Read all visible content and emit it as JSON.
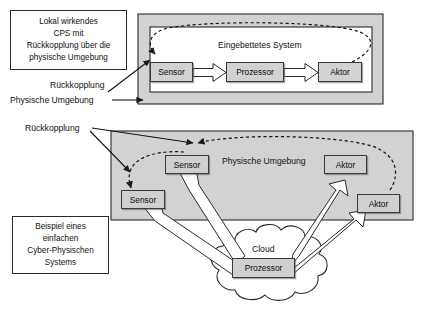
{
  "figure": {
    "colors": {
      "environment_fill": "#d2d2d2",
      "node_fill": "#d2d2d2",
      "stroke": "#2a2a2a",
      "background": "#ffffff"
    }
  },
  "top_panel": {
    "callout": {
      "lines": [
        "Lokal wirkendes",
        "CPS mit",
        "Rückkopplung über die",
        "physische Umgebung"
      ]
    },
    "annotations": [
      {
        "label": "Rückkopplung"
      },
      {
        "label": "Physische Umgebung"
      }
    ],
    "embedded_system_label": "Eingebettetes System",
    "nodes": [
      {
        "label": "Sensor"
      },
      {
        "label": "Prozessor"
      },
      {
        "label": "Aktor"
      }
    ]
  },
  "bottom_panel": {
    "callout": {
      "lines": [
        "Beispiel eines",
        "einfachen",
        "Cyber-Physischen",
        "Systems"
      ]
    },
    "annotations": [
      {
        "label": "Rückkopplung"
      }
    ],
    "environment_label": "Physische Umgebung",
    "cloud_label": "Cloud",
    "nodes": [
      {
        "label": "Sensor"
      },
      {
        "label": "Sensor"
      },
      {
        "label": "Aktor"
      },
      {
        "label": "Aktor"
      },
      {
        "label": "Prozessor"
      }
    ]
  }
}
